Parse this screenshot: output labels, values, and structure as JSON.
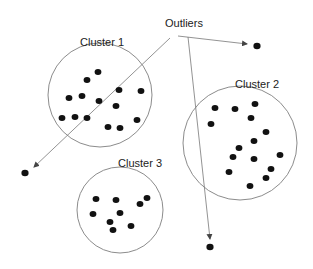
{
  "diagram": {
    "title_label": "Outliers",
    "colors": {
      "point": "#111111",
      "circle": "#8c8c8c",
      "arrow": "#777777",
      "text": "#222222"
    },
    "clusters": [
      {
        "label": "Cluster 1",
        "center": [
          100,
          95
        ],
        "radius": 52,
        "label_pos": [
          80,
          46
        ],
        "points": [
          [
            98,
            72
          ],
          [
            87,
            80
          ],
          [
            119,
            90
          ],
          [
            141,
            91
          ],
          [
            69,
            98
          ],
          [
            82,
            96
          ],
          [
            99,
            101
          ],
          [
            116,
            106
          ],
          [
            62,
            118
          ],
          [
            75,
            117
          ],
          [
            87,
            118
          ],
          [
            137,
            120
          ],
          [
            108,
            127
          ],
          [
            120,
            128
          ]
        ]
      },
      {
        "label": "Cluster 2",
        "center": [
          240,
          143
        ],
        "radius": 57,
        "label_pos": [
          235,
          88
        ],
        "points": [
          [
            215,
            108
          ],
          [
            235,
            109
          ],
          [
            255,
            104
          ],
          [
            211,
            124
          ],
          [
            251,
            118
          ],
          [
            266,
            132
          ],
          [
            254,
            141
          ],
          [
            239,
            148
          ],
          [
            280,
            155
          ],
          [
            233,
            157
          ],
          [
            254,
            159
          ],
          [
            229,
            172
          ],
          [
            271,
            169
          ],
          [
            266,
            178
          ],
          [
            250,
            186
          ]
        ]
      },
      {
        "label": "Cluster 3",
        "center": [
          120,
          210
        ],
        "radius": 43,
        "label_pos": [
          118,
          167
        ],
        "points": [
          [
            96,
            199
          ],
          [
            116,
            200
          ],
          [
            147,
            198
          ],
          [
            140,
            204
          ],
          [
            93,
            214
          ],
          [
            120,
            213
          ],
          [
            110,
            222
          ],
          [
            131,
            226
          ],
          [
            113,
            230
          ]
        ]
      }
    ],
    "outliers": [
      [
        257,
        46
      ],
      [
        25,
        173
      ],
      [
        210,
        247
      ]
    ],
    "arrows": [
      {
        "from": [
          178,
          36
        ],
        "to": [
          247,
          44
        ]
      },
      {
        "from": [
          170,
          38
        ],
        "to": [
          34,
          167
        ]
      },
      {
        "from": [
          188,
          37
        ],
        "to": [
          210,
          239
        ]
      }
    ]
  }
}
